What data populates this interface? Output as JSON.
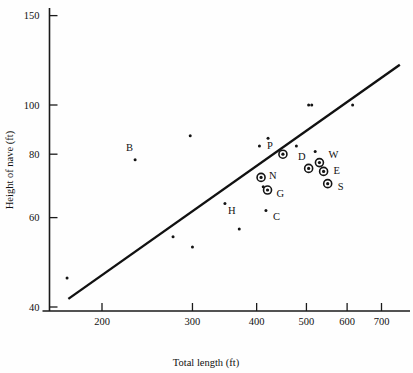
{
  "chart_data": {
    "type": "scatter",
    "title": "",
    "xlabel": "Total length (ft)",
    "ylabel": "Height of nave (ft)",
    "xscale": "log",
    "yscale": "log",
    "xlim": [
      165,
      770
    ],
    "ylim": [
      39,
      158
    ],
    "grid": false,
    "legend": null,
    "xticks": [
      200,
      300,
      400,
      500,
      600,
      700
    ],
    "xtick_labels": [
      "200",
      "300",
      "400",
      "500",
      "600",
      "700"
    ],
    "yticks": [
      40,
      60,
      80,
      100,
      150
    ],
    "ytick_labels": [
      "40",
      "60",
      "80",
      "100",
      "150"
    ],
    "trendline": {
      "label": "",
      "x_start": 172,
      "y_start": 41.5,
      "x_end": 760,
      "y_end": 120
    },
    "labeled_points": [
      {
        "label": "B",
        "x": 232,
        "y": 78,
        "marker": "dot",
        "label_dx": -2,
        "label_dy": -9
      },
      {
        "label": "H",
        "x": 347,
        "y": 64,
        "marker": "dot",
        "label_dx": 3,
        "label_dy": 11
      },
      {
        "label": "N",
        "x": 408,
        "y": 72,
        "marker": "ring",
        "label_dx": 8,
        "label_dy": 2
      },
      {
        "label": "G",
        "x": 420,
        "y": 68,
        "marker": "ring",
        "label_dx": 9,
        "label_dy": 7
      },
      {
        "label": "C",
        "x": 417,
        "y": 62,
        "marker": "dot",
        "label_dx": 7,
        "label_dy": 10
      },
      {
        "label": "P",
        "x": 450,
        "y": 80,
        "marker": "ring",
        "label_dx": -10,
        "label_dy": -5
      },
      {
        "label": "D",
        "x": 505,
        "y": 75,
        "marker": "ring",
        "label_dx": -3,
        "label_dy": -8
      },
      {
        "label": "W",
        "x": 530,
        "y": 77,
        "marker": "ring",
        "label_dx": 9,
        "label_dy": -5
      },
      {
        "label": "E",
        "x": 540,
        "y": 74,
        "marker": "ring",
        "label_dx": 10,
        "label_dy": 3
      },
      {
        "label": "S",
        "x": 550,
        "y": 70,
        "marker": "ring",
        "label_dx": 10,
        "label_dy": 6
      }
    ],
    "unlabeled_points": [
      {
        "x": 171,
        "y": 45.6
      },
      {
        "x": 275,
        "y": 55
      },
      {
        "x": 297,
        "y": 87
      },
      {
        "x": 300,
        "y": 52.5
      },
      {
        "x": 370,
        "y": 57
      },
      {
        "x": 405,
        "y": 83
      },
      {
        "x": 412,
        "y": 69
      },
      {
        "x": 421,
        "y": 86
      },
      {
        "x": 478,
        "y": 83
      },
      {
        "x": 505,
        "y": 100
      },
      {
        "x": 512,
        "y": 100
      },
      {
        "x": 520,
        "y": 81
      },
      {
        "x": 615,
        "y": 100
      }
    ]
  },
  "axis": {
    "x_title": "Total length (ft)",
    "y_title": "Height of nave (ft)"
  }
}
